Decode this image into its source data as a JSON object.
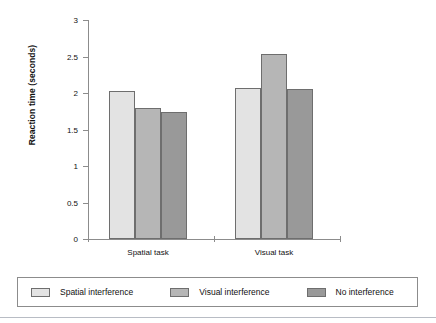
{
  "chart_data": {
    "type": "bar",
    "title": "",
    "subtitle": "",
    "xlabel": "",
    "ylabel": "Reaction time (seconds)",
    "categories": [
      "Spatial task",
      "Visual task"
    ],
    "series": [
      {
        "name": "Spatial interference",
        "color": "#e3e3e3",
        "values": [
          2.03,
          2.07
        ]
      },
      {
        "name": "Visual interference",
        "color": "#b6b6b6",
        "values": [
          1.79,
          2.54
        ]
      },
      {
        "name": "No interference",
        "color": "#999999",
        "values": [
          1.74,
          2.05
        ]
      }
    ],
    "ylim": [
      0,
      3
    ],
    "yticks": [
      0,
      0.5,
      1,
      1.5,
      2,
      2.5,
      3
    ],
    "ytick_labels": [
      "0",
      "0.5",
      "1",
      "1.5",
      "2",
      "2.5",
      "3"
    ],
    "grid": false,
    "legend_position": "bottom",
    "axis_color": "#8c8c8c",
    "bar_border_color": "#6e6e6e"
  },
  "legend": {
    "items": [
      {
        "label": "Spatial interference",
        "color": "#e3e3e3"
      },
      {
        "label": "Visual interference",
        "color": "#b6b6b6"
      },
      {
        "label": "No interference",
        "color": "#999999"
      }
    ]
  }
}
